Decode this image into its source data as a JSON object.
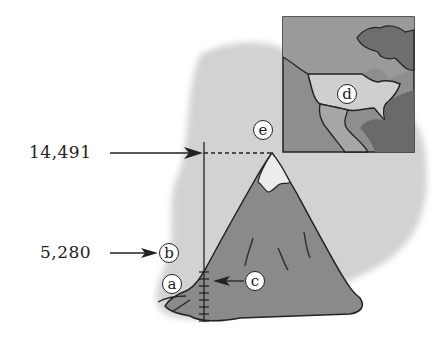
{
  "diagram": {
    "elevation_labels": {
      "summit": "14,491",
      "mile": "5,280"
    },
    "markers": {
      "a": "a",
      "b": "b",
      "c": "c",
      "d": "d",
      "e": "e"
    },
    "colors": {
      "background_wash": "#d2d2d2",
      "mountain": "#8a8a8a",
      "snow": "#ececec",
      "map_ocean": "#8e8e8e",
      "map_land_highlight": "#cfcfcf",
      "map_land": "#a6a6a6",
      "ink": "#222222"
    }
  }
}
